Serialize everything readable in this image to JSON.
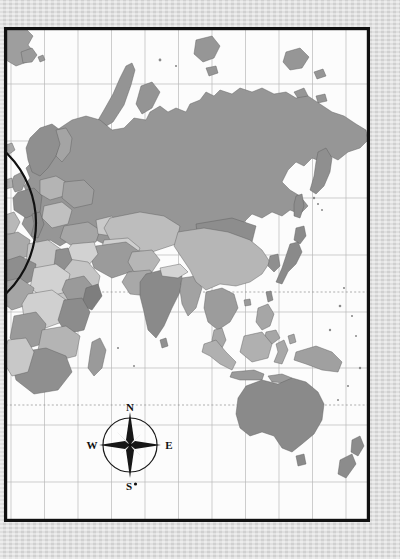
{
  "document": {
    "kind": "world-map-print",
    "region_shown": "Eurasia, Africa, Oceania and western Pacific",
    "paper_color": "#d9d9d9",
    "ocean_color": "#fcfcfc",
    "frame_color": "#111111"
  },
  "frame": {
    "left": 4,
    "top": 27,
    "right": 370,
    "bottom": 522,
    "stroke_width": 3.2
  },
  "graticule": {
    "grid_color": "#b9b9b9",
    "vertical_lines_x": [
      11,
      44.5,
      78,
      111.5,
      145,
      178.5,
      212,
      245.5,
      279,
      312.5,
      346
    ],
    "horizontal_lines_y": [
      84,
      141,
      198,
      255,
      312,
      368,
      425,
      482
    ],
    "special_lines": [
      {
        "name": "tropic-of-cancer",
        "y": 292,
        "style": "dotted"
      },
      {
        "name": "tropic-of-capricorn",
        "y": 405,
        "style": "dotted"
      }
    ]
  },
  "inset_arc": {
    "name": "europe-inset-circle-edge",
    "description": "black circular arc clipped at the left edge over Europe",
    "cx": -62,
    "cy": 223,
    "r": 98,
    "stroke": "#111111"
  },
  "compass_rose": {
    "name": "compass-rose",
    "cx": 130,
    "cy": 445,
    "radius": 27,
    "labels": {
      "north": "N",
      "east": "E",
      "south": "S",
      "west": "W"
    },
    "points": 8,
    "ring_stroke": "#1a1a1a",
    "major_point_fill": "#171717",
    "minor_point_fill": "#5a5a5a"
  },
  "legend_palette": {
    "very_light": "#dcdcdc",
    "light": "#c9c9c9",
    "medium_light": "#b6b6b6",
    "medium": "#a2a2a2",
    "medium_dark": "#969696",
    "dark": "#8a8a8a",
    "very_dark": "#767676",
    "outline": "#5d5d5d"
  },
  "landmasses": [
    {
      "name": "russia",
      "fill": "#969696"
    },
    {
      "name": "scandinavia",
      "fill": "#8f8f8f"
    },
    {
      "name": "europe-cluster",
      "fill": "#a8a8a8"
    },
    {
      "name": "china",
      "fill": "#b6b6b6"
    },
    {
      "name": "mongolia",
      "fill": "#8d8d8d"
    },
    {
      "name": "kazakhstan",
      "fill": "#bdbdbd"
    },
    {
      "name": "india",
      "fill": "#8a8a8a"
    },
    {
      "name": "iran",
      "fill": "#9b9b9b"
    },
    {
      "name": "arabian-peninsula",
      "fill": "#c5c5c5"
    },
    {
      "name": "japan",
      "fill": "#8a8a8a"
    },
    {
      "name": "korea",
      "fill": "#8f8f8f"
    },
    {
      "name": "southeast-asia",
      "fill": "#9c9c9c"
    },
    {
      "name": "indonesia",
      "fill": "#b0b0b0"
    },
    {
      "name": "new-guinea",
      "fill": "#a0a0a0"
    },
    {
      "name": "philippines",
      "fill": "#a6a6a6"
    },
    {
      "name": "australia",
      "fill": "#8a8a8a"
    },
    {
      "name": "new-zealand",
      "fill": "#8c8c8c"
    },
    {
      "name": "africa-north",
      "fill": "#c6c6c6"
    },
    {
      "name": "africa-west",
      "fill": "#a5a5a5"
    },
    {
      "name": "africa-central",
      "fill": "#d2d2d2"
    },
    {
      "name": "africa-south",
      "fill": "#8f8f8f"
    },
    {
      "name": "madagascar",
      "fill": "#9a9a9a"
    },
    {
      "name": "greenland-edge",
      "fill": "#9e9e9e"
    },
    {
      "name": "svalbard",
      "fill": "#9a9a9a"
    },
    {
      "name": "novaya-zemlya",
      "fill": "#949494"
    },
    {
      "name": "kamchatka",
      "fill": "#8f8f8f"
    },
    {
      "name": "sri-lanka",
      "fill": "#909090"
    },
    {
      "name": "taiwan",
      "fill": "#8e8e8e"
    },
    {
      "name": "tasmania",
      "fill": "#8a8a8a"
    }
  ]
}
